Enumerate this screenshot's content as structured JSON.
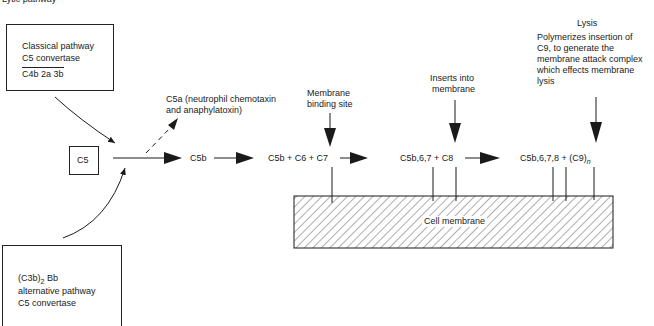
{
  "header": {
    "title": "Lytic pathway"
  },
  "classical_box": {
    "line1": "Classical pathway",
    "line2": "C5 convertase",
    "line3": "C4b 2a 3b"
  },
  "alternative_box": {
    "line1_prefix": "(C3b)",
    "line1_sub": "2",
    "line1_suffix": " Bb",
    "line2": "alternative pathway",
    "line3": "C5 convertase"
  },
  "c5_box": {
    "label": "C5"
  },
  "c5a_label": {
    "line1": "C5a (neutrophil chemotaxin",
    "line2": "and anaphylatoxin)"
  },
  "nodes": {
    "c5b": "C5b",
    "c5b_c6_c7": "C5b + C6 + C7",
    "c5b67_c8": "C5b,6,7 + C8",
    "c5b678_c9_prefix": "C5b,6,7,8 + (C9)",
    "c5b678_c9_sub": "n"
  },
  "annotations": {
    "membrane_binding": {
      "line1": "Membrane",
      "line2": "binding site"
    },
    "inserts": {
      "line1": "Inserts into",
      "line2": "membrane"
    },
    "lysis_title": "Lysis",
    "lysis_desc": {
      "line1": "Polymerizes insertion of",
      "line2": "C9, to generate the",
      "line3": "membrane attack complex",
      "line4": "which effects membrane",
      "line5": "lysis"
    }
  },
  "membrane": {
    "label": "Cell membrane"
  },
  "colors": {
    "ink": "#1a1a1a",
    "background": "#ffffff"
  }
}
